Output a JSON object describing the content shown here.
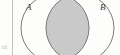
{
  "figure": {
    "type": "venn-diagram",
    "sets": [
      {
        "id": "A",
        "label": "A",
        "cx": 55,
        "cy": 28,
        "r": 34
      },
      {
        "id": "B",
        "label": "B",
        "cx": 80,
        "cy": 28,
        "r": 34
      }
    ],
    "shaded_region": "A ∩ B",
    "shaded_fill": "#c9c9c9",
    "stroke_color": "#6b6b6b",
    "background": "#fdfdfc",
    "margin_rule": {
      "x": 12,
      "color": "#c3c3c3"
    },
    "margin_note": "rrl"
  }
}
